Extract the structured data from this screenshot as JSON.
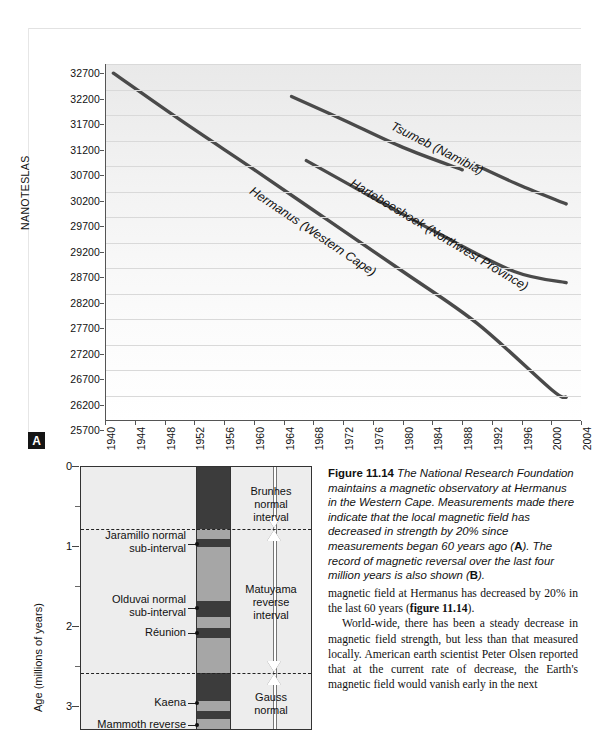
{
  "figure": {
    "number": "11.14",
    "panel_a_tag": "A",
    "panel_b_tag": "B",
    "caption_lead": "Figure 11.14",
    "caption_text": " The National Research Foundation maintains a magnetic observatory at Hermanus in the Western Cape. Measurements made there indicate that the local magnetic field has decreased in strength by 20% since measurements began 60 years ago (",
    "caption_mid": "). The record of magnetic reversal over the last four million years is also shown (",
    "caption_end": ")."
  },
  "chart_data": {
    "type": "line",
    "title": "",
    "xlabel": "",
    "ylabel": "NANOTESLAS",
    "xlim": [
      1940,
      2004
    ],
    "ylim": [
      25700,
      32700
    ],
    "grid": true,
    "legend": "inline-labels",
    "y_ticks": [
      25700,
      26200,
      26700,
      27200,
      27700,
      28200,
      28700,
      29200,
      29700,
      30200,
      30700,
      31200,
      31700,
      32200,
      32700
    ],
    "x_ticks": [
      1940,
      1944,
      1948,
      1952,
      1956,
      1960,
      1964,
      1968,
      1972,
      1976,
      1980,
      1984,
      1988,
      1992,
      1996,
      2000,
      2004
    ],
    "series": [
      {
        "name": "Hermanus (Western Cape)",
        "x": [
          1941,
          1950,
          1960,
          1970,
          1980,
          1990,
          2000,
          2002
        ],
        "values": [
          32520,
          31600,
          30620,
          29620,
          28620,
          27600,
          26300,
          26150
        ]
      },
      {
        "name": "Tsumeb (Namibia)",
        "x": [
          1965,
          1972,
          1980,
          1988
        ],
        "values": [
          32060,
          31600,
          31060,
          30620
        ]
      },
      {
        "name": "Tsumeb (Namibia) segment 2",
        "x": [
          1990,
          1996,
          2002
        ],
        "values": [
          30700,
          30300,
          29950
        ]
      },
      {
        "name": "Hartebeeshoek (Northwest Province)",
        "x": [
          1967,
          1975,
          1985,
          1995,
          2002
        ],
        "values": [
          30800,
          30150,
          29350,
          28620,
          28400
        ]
      }
    ]
  },
  "polarity_chart": {
    "type": "column-timescale",
    "ylabel": "Age (millions of years)",
    "y_ticks": [
      0,
      1,
      2,
      3
    ],
    "y_minor_ticks": [
      0.5,
      1.5,
      2.5
    ],
    "ylim": [
      0,
      3.3
    ],
    "epochs": [
      {
        "name": "Brunhes\nnormal\ninterval",
        "line1": "Brunhes",
        "line2": "normal",
        "line3": "interval"
      },
      {
        "name": "Matuyama reverse interval",
        "line1": "Matuyama",
        "line2": "reverse",
        "line3": "interval"
      },
      {
        "name": "Gauss normal",
        "line1": "Gauss",
        "line2": "normal",
        "line3": ""
      }
    ],
    "sub_intervals": [
      {
        "line1": "Jaramillo normal",
        "line2": "sub-interval"
      },
      {
        "line1": "Olduvai normal",
        "line2": "sub-interval"
      },
      {
        "line1": "Réunion",
        "line2": ""
      },
      {
        "line1": "Kaena",
        "line2": ""
      },
      {
        "line1": "Mammoth reverse",
        "line2": ""
      }
    ],
    "polarity_bands": [
      {
        "polarity": "normal",
        "from": 0.0,
        "to": 0.78
      },
      {
        "polarity": "reverse",
        "from": 0.78,
        "to": 0.9
      },
      {
        "polarity": "normal",
        "from": 0.9,
        "to": 1.0
      },
      {
        "polarity": "reverse",
        "from": 1.0,
        "to": 1.67
      },
      {
        "polarity": "normal",
        "from": 1.67,
        "to": 1.87
      },
      {
        "polarity": "reverse",
        "from": 1.87,
        "to": 2.01
      },
      {
        "polarity": "normal",
        "from": 2.01,
        "to": 2.14
      },
      {
        "polarity": "reverse",
        "from": 2.14,
        "to": 2.58
      },
      {
        "polarity": "normal",
        "from": 2.58,
        "to": 2.92
      },
      {
        "polarity": "reverse",
        "from": 2.92,
        "to": 3.05
      },
      {
        "polarity": "normal",
        "from": 3.05,
        "to": 3.15
      },
      {
        "polarity": "reverse",
        "from": 3.15,
        "to": 3.3
      }
    ],
    "epoch_boundaries": [
      0.78,
      2.58
    ]
  },
  "body": {
    "para1_a": "magnetic field at Hermanus has decreased by 20% in the last 60 years (",
    "para1_bold": "figure 11.14",
    "para1_b": ").",
    "para2": "World-wide, there has been a steady decrease in magnetic field strength, but less than that measured locally. American earth scientist Peter Olsen reported that at the current rate of decrease, the Earth's magnetic field would vanish early in the next"
  },
  "colors": {
    "line": "#4a4a4a",
    "normal_band": "#3c3c3c",
    "reverse_band": "#a6a6a6",
    "grid": "#d9d9d9",
    "axis": "#555555"
  }
}
